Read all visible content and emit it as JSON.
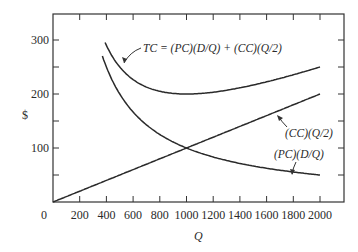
{
  "chart_data": {
    "type": "line",
    "title": "",
    "xlabel": "Q",
    "ylabel": "$",
    "xlim": [
      0,
      2175
    ],
    "ylim": [
      0,
      350
    ],
    "x_ticks": [
      0,
      200,
      400,
      600,
      800,
      1000,
      1200,
      1400,
      1600,
      1800,
      2000
    ],
    "y_ticks": [
      100,
      200,
      300
    ],
    "x_tick_labels": [
      "0",
      "200",
      "400",
      "600",
      "800",
      "1000",
      "1200",
      "1400",
      "1600",
      "1800",
      "2000"
    ],
    "y_tick_labels": [
      "100",
      "200",
      "300"
    ],
    "grid": false,
    "legend": "none (curves annotated directly)",
    "series": [
      {
        "name": "TC = (PC)(D/Q) + (CC)(Q/2)",
        "x": [
          375,
          400,
          500,
          600,
          700,
          800,
          900,
          1000,
          1200,
          1400,
          1600,
          1800,
          2000
        ],
        "values": [
          304,
          290,
          250,
          227,
          213,
          205,
          201,
          200,
          203,
          211,
          223,
          236,
          250
        ]
      },
      {
        "name": "(CC)(Q/2)",
        "x": [
          0,
          500,
          1000,
          1500,
          2000
        ],
        "values": [
          0,
          50,
          100,
          150,
          200
        ]
      },
      {
        "name": "(PC)(D/Q)",
        "x": [
          400,
          500,
          600,
          700,
          800,
          900,
          1000,
          1200,
          1400,
          1600,
          1800,
          2000
        ],
        "values": [
          250,
          200,
          167,
          143,
          125,
          111,
          100,
          83,
          71,
          63,
          56,
          50
        ]
      }
    ],
    "annotations": [
      "TC = (PC)(D/Q) + (CC)(Q/2)",
      "(CC)(Q/2)",
      "(PC)(D/Q)"
    ]
  },
  "axes": {
    "xlabel": "Q",
    "ylabel": "$",
    "origin_label": "0"
  },
  "annotations": {
    "tc": "TC = (PC)(D/Q) + (CC)(Q/2)",
    "cc": "(CC)(Q/2)",
    "pc": "(PC)(D/Q)"
  }
}
